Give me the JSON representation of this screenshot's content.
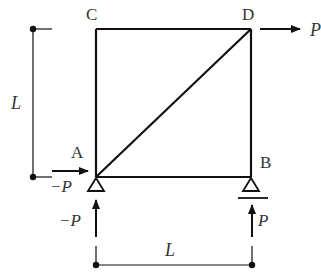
{
  "diagram": {
    "type": "truss",
    "nodes": [
      {
        "id": "C",
        "label": "C"
      },
      {
        "id": "D",
        "label": "D"
      },
      {
        "id": "A",
        "label": "A"
      },
      {
        "id": "B",
        "label": "B"
      }
    ],
    "members": [
      "C-D",
      "C-A",
      "D-B",
      "A-B",
      "A-D"
    ],
    "supports": [
      {
        "node": "A",
        "type": "pin"
      },
      {
        "node": "B",
        "type": "roller"
      }
    ],
    "loads": {
      "D_horizontal": "P",
      "A_horizontal": "−P",
      "A_vertical": "−P",
      "B_vertical": "P"
    },
    "dimensions": {
      "height": "L",
      "width": "L"
    },
    "colors": {
      "line": "#111111",
      "text": "#333333"
    }
  }
}
